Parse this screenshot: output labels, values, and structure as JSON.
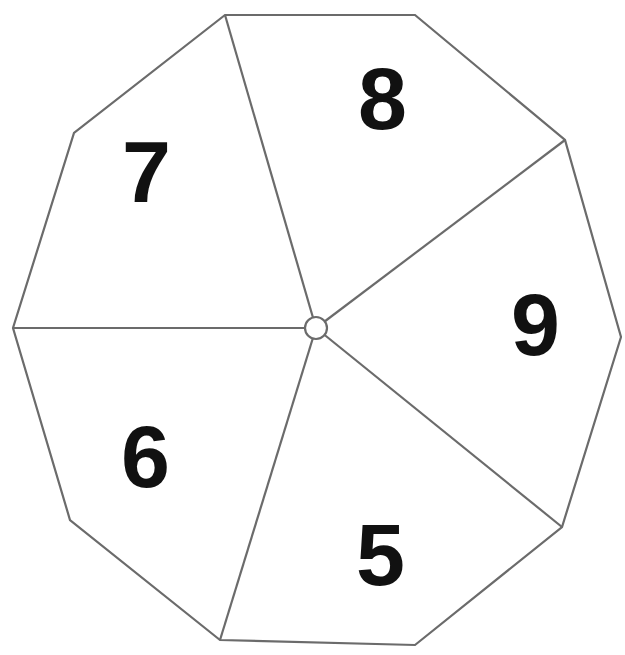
{
  "diagram": {
    "shape_name": "decagon-wheel",
    "stroke_color": "#6b6b6b",
    "fill_color": "#ffffff",
    "label_color": "#111111",
    "canvas": {
      "width": 625,
      "height": 655
    },
    "hub": {
      "cx": 316,
      "cy": 328,
      "r": 11,
      "name": "center-hub"
    },
    "outline_points": "225,15 415,15 565,140 621,337 562,527 415,645 220,640 70,520 13,328 74,133",
    "vertices": [
      {
        "name": "vertex-top-left",
        "x": 225,
        "y": 15
      },
      {
        "name": "vertex-top-right",
        "x": 415,
        "y": 15
      },
      {
        "name": "vertex-upper-right",
        "x": 565,
        "y": 140
      },
      {
        "name": "vertex-right",
        "x": 621,
        "y": 337
      },
      {
        "name": "vertex-lower-right",
        "x": 562,
        "y": 527
      },
      {
        "name": "vertex-bottom-right",
        "x": 415,
        "y": 645
      },
      {
        "name": "vertex-bottom-left",
        "x": 220,
        "y": 640
      },
      {
        "name": "vertex-lower-left",
        "x": 70,
        "y": 520
      },
      {
        "name": "vertex-left",
        "x": 13,
        "y": 328
      },
      {
        "name": "vertex-upper-left",
        "x": 74,
        "y": 133
      }
    ],
    "spokes": [
      {
        "name": "spoke-to-top-left",
        "x1": 316,
        "y1": 328,
        "x2": 225,
        "y2": 15
      },
      {
        "name": "spoke-to-upper-right",
        "x1": 316,
        "y1": 328,
        "x2": 565,
        "y2": 140
      },
      {
        "name": "spoke-to-lower-right",
        "x1": 316,
        "y1": 328,
        "x2": 562,
        "y2": 527
      },
      {
        "name": "spoke-to-bottom-left",
        "x1": 316,
        "y1": 328,
        "x2": 220,
        "y2": 640
      },
      {
        "name": "spoke-to-left",
        "x1": 316,
        "y1": 328,
        "x2": 13,
        "y2": 328
      }
    ],
    "sectors": [
      {
        "name": "sector-8",
        "label": "8",
        "x": 382,
        "y": 106,
        "font_size": 88
      },
      {
        "name": "sector-9",
        "label": "9",
        "x": 535,
        "y": 332,
        "font_size": 88
      },
      {
        "name": "sector-5",
        "label": "5",
        "x": 380,
        "y": 562,
        "font_size": 88
      },
      {
        "name": "sector-6",
        "label": "6",
        "x": 145,
        "y": 464,
        "font_size": 88
      },
      {
        "name": "sector-7",
        "label": "7",
        "x": 146,
        "y": 179,
        "font_size": 88
      }
    ]
  }
}
